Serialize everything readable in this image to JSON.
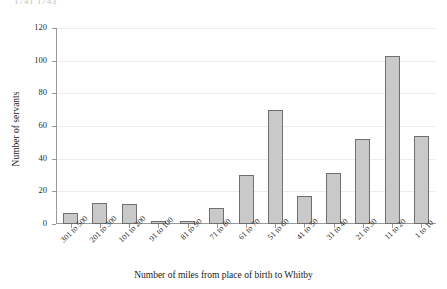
{
  "top_caption": "1741  1743",
  "chart_data": {
    "type": "bar",
    "title": "",
    "xlabel": "Number of miles from place of birth to Whitby",
    "ylabel": "Number of servants",
    "categories": [
      "301 to 500",
      "201 to 300",
      "101 to 200",
      "91 to 100",
      "81 to 90",
      "71 to 80",
      "61 to 70",
      "51 to 60",
      "41 to 50",
      "31 to 40",
      "21 to 30",
      "11 to 20",
      "1 to 10"
    ],
    "values": [
      7,
      13,
      12,
      2,
      2,
      10,
      30,
      70,
      17,
      31,
      52,
      103,
      54
    ],
    "ylim": [
      0,
      120
    ],
    "yticks": [
      0,
      20,
      40,
      60,
      80,
      100,
      120
    ],
    "grid": true,
    "legend": "none",
    "bar_fill": "#c9c9c9",
    "bar_border": "#6f6f6f"
  }
}
